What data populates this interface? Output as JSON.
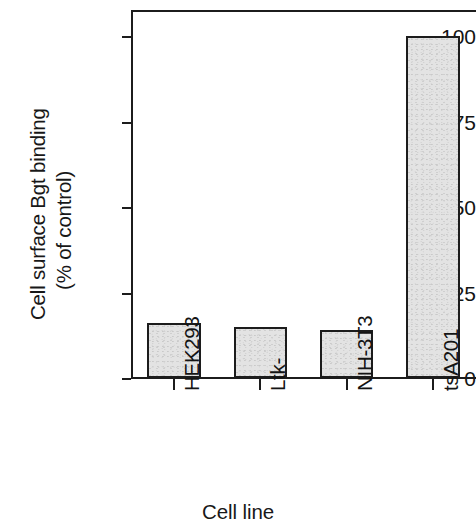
{
  "chart_data": {
    "type": "bar",
    "title": "",
    "xlabel": "Cell line",
    "ylabel": "Cell surface Bgt binding (% of control)",
    "ylabel_lines": [
      "Cell surface Bgt binding",
      "(% of control)"
    ],
    "categories": [
      "HEK293",
      "Ltk-",
      "NIH-3T3",
      "tsA201"
    ],
    "values": [
      16,
      15,
      14,
      100
    ],
    "ylim": [
      0,
      108
    ],
    "yticks": [
      0,
      25,
      50,
      75,
      100
    ],
    "ytick_labels": [
      "0",
      "25",
      "50",
      "75",
      "100"
    ],
    "grid": false,
    "legend": null,
    "bar_fill_color": "#e3e3e3",
    "bar_edge_color": "#1c1c1c",
    "axis_color": "#1c1c1c",
    "background_color": "#ffffff"
  },
  "axes": {
    "y_title_line1": "Cell surface Bgt binding",
    "y_title_line2": "(% of control)",
    "x_title": "Cell line"
  }
}
